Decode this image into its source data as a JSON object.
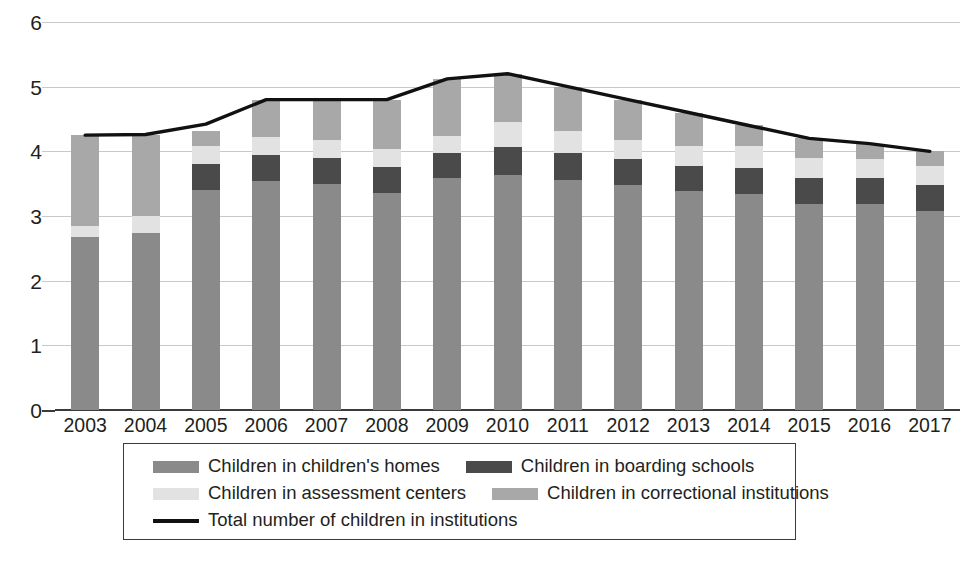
{
  "chart_data": {
    "type": "bar",
    "subtype": "stacked-bar-with-line-overlay",
    "title": "",
    "xlabel": "",
    "ylabel": "",
    "ylim": [
      0,
      6
    ],
    "yticks": [
      0,
      1,
      2,
      3,
      4,
      5,
      6
    ],
    "grid": true,
    "legend_position": "bottom",
    "categories": [
      "2003",
      "2004",
      "2005",
      "2006",
      "2007",
      "2008",
      "2009",
      "2010",
      "2011",
      "2012",
      "2013",
      "2014",
      "2015",
      "2016",
      "2017"
    ],
    "series": [
      {
        "name": "Children in children's homes",
        "color": "#8a8a8a",
        "values": [
          2.68,
          2.74,
          3.4,
          3.54,
          3.5,
          3.36,
          3.58,
          3.64,
          3.56,
          3.48,
          3.38,
          3.34,
          3.18,
          3.18,
          3.08
        ]
      },
      {
        "name": "Children in boarding schools",
        "color": "#4a4a4a",
        "values": [
          0.0,
          0.0,
          0.4,
          0.4,
          0.4,
          0.4,
          0.4,
          0.42,
          0.42,
          0.4,
          0.4,
          0.4,
          0.4,
          0.4,
          0.4
        ]
      },
      {
        "name": "Children in assessment centers",
        "color": "#e2e2e2",
        "values": [
          0.16,
          0.26,
          0.28,
          0.28,
          0.28,
          0.28,
          0.26,
          0.4,
          0.34,
          0.3,
          0.3,
          0.34,
          0.32,
          0.3,
          0.3
        ]
      },
      {
        "name": "Children in correctional institutions",
        "color": "#a8a8a8",
        "values": [
          1.41,
          1.26,
          0.24,
          0.58,
          0.6,
          0.76,
          0.88,
          0.74,
          0.68,
          0.62,
          0.52,
          0.32,
          0.3,
          0.24,
          0.22
        ]
      }
    ],
    "line_series": {
      "name": "Total number of children in institutions",
      "color": "#111111",
      "values": [
        4.25,
        4.26,
        4.42,
        4.8,
        4.8,
        4.8,
        5.12,
        5.2,
        5.0,
        4.8,
        4.6,
        4.4,
        4.2,
        4.12,
        4.0
      ]
    }
  },
  "yaxis": {
    "ticks": [
      "6",
      "5",
      "4",
      "3",
      "2",
      "1",
      "0"
    ]
  },
  "xaxis": {
    "labels": [
      "2003",
      "2004",
      "2005",
      "2006",
      "2007",
      "2008",
      "2009",
      "2010",
      "2011",
      "2012",
      "2013",
      "2014",
      "2015",
      "2016",
      "2017"
    ]
  },
  "legend": {
    "row1": [
      {
        "label": "Children in children's homes",
        "swatch": "swatch-homes"
      },
      {
        "label": "Children in boarding schools",
        "swatch": "swatch-boarding"
      }
    ],
    "row2": [
      {
        "label": "Children in assessment centers",
        "swatch": "swatch-assessment"
      },
      {
        "label": "Children in correctional institutions",
        "swatch": "swatch-correctional"
      }
    ],
    "row3": [
      {
        "label": "Total number of children in institutions",
        "swatch": "swatch-line"
      }
    ]
  }
}
